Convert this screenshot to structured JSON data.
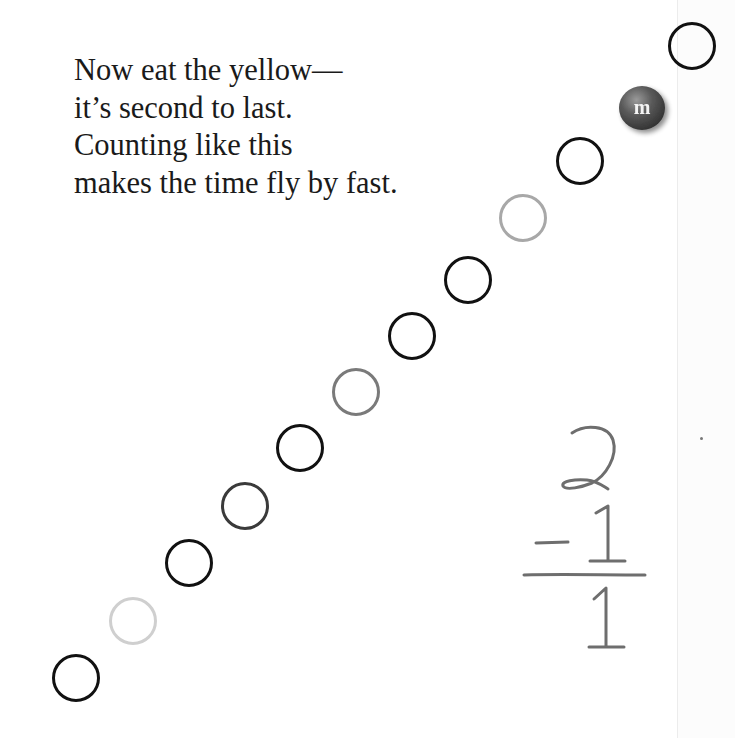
{
  "rhyme": {
    "lines": [
      "Now eat the yellow—",
      "it’s second to last.",
      "Counting like this",
      "makes the time fly by fast."
    ]
  },
  "candy": {
    "label": "m",
    "color": "#5a5a5a"
  },
  "circles": [
    {
      "stroke": "#111111"
    },
    {
      "stroke": "#cfcfcf"
    },
    {
      "stroke": "#111111"
    },
    {
      "stroke": "#3a3a3a"
    },
    {
      "stroke": "#111111"
    },
    {
      "stroke": "#7a7a7a"
    },
    {
      "stroke": "#111111"
    },
    {
      "stroke": "#111111"
    },
    {
      "stroke": "#a8a8a8"
    },
    {
      "stroke": "#111111"
    },
    {
      "candy": true
    },
    {
      "stroke": "#111111"
    }
  ],
  "math": {
    "minuend": "2",
    "operator": "-",
    "subtrahend": "1",
    "difference": "1",
    "pencil_color": "#6e6e6e"
  }
}
